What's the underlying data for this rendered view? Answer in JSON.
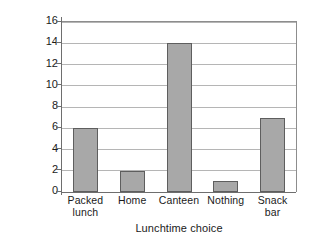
{
  "chart_data": {
    "type": "bar",
    "title": "",
    "subtitle": "",
    "xlabel": "Lunchtime choice",
    "ylabel": "Number of students",
    "categories": [
      "Packed lunch",
      "Home",
      "Canteen",
      "Nothing",
      "Snack bar"
    ],
    "category_lines": [
      [
        "Packed",
        "lunch"
      ],
      [
        "Home",
        ""
      ],
      [
        "Canteen",
        ""
      ],
      [
        "Nothing",
        ""
      ],
      [
        "Snack",
        "bar"
      ]
    ],
    "values": [
      6,
      2,
      14,
      1,
      7
    ],
    "ylim": [
      0,
      16
    ],
    "ytick_step": 2,
    "yticks": [
      0,
      2,
      4,
      6,
      8,
      10,
      12,
      14,
      16
    ],
    "ytick_labels": [
      "0",
      "2",
      "4",
      "6",
      "8",
      "10",
      "12",
      "14",
      "16"
    ],
    "grid": true,
    "grid_axis": "y",
    "legend": false,
    "legend_position": "none",
    "bar_fill_color": "#a8a8a8",
    "bar_edge_color": "#5e5e5e",
    "gridline_color": "#b5b5b5",
    "axis_color": "#6e6e6e",
    "background_color": "#ffffff"
  }
}
